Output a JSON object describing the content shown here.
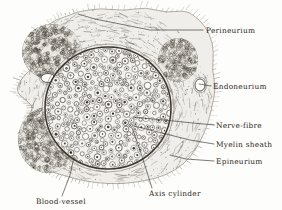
{
  "figure": {
    "medium": "engraving",
    "background_color": "#fdfdfb",
    "ink_color": "#2b2722",
    "width": 282,
    "height": 210
  },
  "labels": [
    {
      "id": "perineurium",
      "text": "Perineurium",
      "text_x": 206,
      "text_y": 33,
      "anchor": "start",
      "leader": [
        [
          203,
          30
        ],
        [
          150,
          30
        ],
        [
          95,
          19
        ],
        [
          78,
          14
        ]
      ],
      "target_structure": "perineurial-sheath-upper-left"
    },
    {
      "id": "endoneurium",
      "text": "Endoneurium",
      "text_y": 89,
      "text_x": 213,
      "anchor": "start",
      "leader": [
        [
          211,
          86
        ],
        [
          199,
          84
        ]
      ],
      "target_structure": "endoneurial-vessel-right"
    },
    {
      "id": "nerve-fibre",
      "text": "Nerve-fibre",
      "text_x": 216,
      "text_y": 128,
      "anchor": "start",
      "leader": [
        [
          214,
          125
        ],
        [
          193,
          123
        ],
        [
          133,
          117
        ]
      ],
      "target_structure": "myelinated-fibre-in-fascicle"
    },
    {
      "id": "myelin-sheath",
      "text": "Myelin sheath",
      "text_x": 216,
      "text_y": 147,
      "anchor": "start",
      "leader": [
        [
          214,
          144
        ],
        [
          190,
          140
        ],
        [
          134,
          126
        ]
      ],
      "target_structure": "myelin-ring"
    },
    {
      "id": "epineurium",
      "text": "Epineurium",
      "text_x": 216,
      "text_y": 164,
      "anchor": "start",
      "leader": [
        [
          214,
          161
        ],
        [
          186,
          159
        ],
        [
          170,
          155
        ]
      ],
      "target_structure": "outer-fibrous-coat"
    },
    {
      "id": "axis-cylinder",
      "text": "Axis cylinder",
      "text_x": 149,
      "text_y": 196,
      "anchor": "start",
      "leader": [
        [
          152,
          188
        ],
        [
          140,
          150
        ],
        [
          132,
          128
        ]
      ],
      "target_structure": "axon-core"
    },
    {
      "id": "blood-vessel",
      "text": "Blood-vessel",
      "text_x": 36,
      "text_y": 204,
      "anchor": "start",
      "leader": [
        [
          62,
          196
        ],
        [
          70,
          175
        ],
        [
          74,
          157
        ]
      ],
      "target_structure": "epineurial-blood-vessel"
    }
  ],
  "structures": {
    "fascicle": {
      "name": "nerve-fascicle",
      "center_x": 108,
      "center_y": 108,
      "radius_x": 64,
      "radius_y": 62
    },
    "perineurium_ring": {
      "name": "perineurium-ring",
      "stroke_color": "#3c362e"
    },
    "epineurium": {
      "name": "epineurium-mass"
    },
    "blood_vessels": [
      {
        "name": "vessel-upper-left",
        "x": 48,
        "y": 78,
        "rx": 7,
        "ry": 4.5
      },
      {
        "name": "vessel-lower-left",
        "x": 73,
        "y": 153,
        "rx": 6,
        "ry": 5
      },
      {
        "name": "vessel-right",
        "x": 200,
        "y": 85,
        "rx": 5,
        "ry": 6
      }
    ]
  }
}
